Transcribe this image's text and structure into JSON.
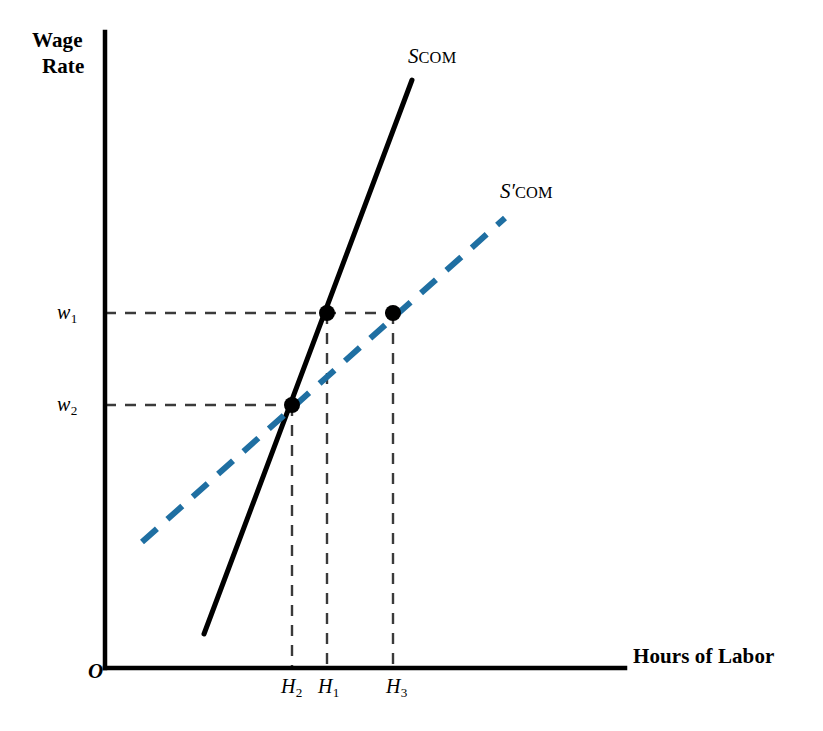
{
  "figure": {
    "axes": {
      "y_title_line1": "Wage",
      "y_title_line2": "Rate",
      "x_title": "Hours of Labor",
      "origin_label": "O"
    },
    "ticks": {
      "y": [
        {
          "name": "w1",
          "symbol": "w",
          "sub": "1"
        },
        {
          "name": "w2",
          "symbol": "w",
          "sub": "2"
        }
      ],
      "x": [
        {
          "name": "H2",
          "symbol": "H",
          "sub": "2"
        },
        {
          "name": "H1",
          "symbol": "H",
          "sub": "1"
        },
        {
          "name": "H3",
          "symbol": "H",
          "sub": "3"
        }
      ]
    },
    "curves": [
      {
        "name": "S_COM",
        "symbol": "S",
        "prime": "",
        "subscript": "COM",
        "style": "solid",
        "color": "#000000"
      },
      {
        "name": "S_COM_prime",
        "symbol": "S",
        "prime": "′",
        "subscript": "COM",
        "style": "dashed",
        "color": "#1f6fa2"
      }
    ],
    "colors": {
      "axis": "#000000",
      "solid_curve": "#000000",
      "dashed_curve": "#1f6fa2",
      "guide_line": "#3a3a3a",
      "point": "#000000",
      "background": "#ffffff"
    }
  },
  "chart_data": {
    "type": "line",
    "title": "",
    "xlabel": "Hours of Labor",
    "ylabel": "Wage Rate",
    "xlim": [
      105,
      625
    ],
    "ylim": [
      668,
      32
    ],
    "grid": false,
    "legend": "inline-curve-labels",
    "axis_origin": {
      "x": 105,
      "y": 668
    },
    "series": [
      {
        "name": "S_COM",
        "label": "S COM",
        "style": "solid",
        "color": "#000000",
        "width": 5,
        "points": [
          [
            204,
            634
          ],
          [
            412,
            80
          ]
        ]
      },
      {
        "name": "S'_COM",
        "label": "S′ COM",
        "style": "dashed",
        "color": "#1f6fa2",
        "width": 6,
        "points": [
          [
            142,
            542
          ],
          [
            505,
            218
          ]
        ]
      }
    ],
    "levels": {
      "w1": 313,
      "w2": 405,
      "H2": 292,
      "H1": 327,
      "H3": 393
    },
    "markers": [
      {
        "name": "point-H1-w1",
        "x": 327,
        "y": 313,
        "r": 8
      },
      {
        "name": "point-H3-w1",
        "x": 393,
        "y": 313,
        "r": 8
      },
      {
        "name": "point-H2-w2",
        "x": 292,
        "y": 405,
        "r": 8
      }
    ],
    "guides": [
      {
        "name": "guide-w1-horizontal",
        "x1": 105,
        "y1": 313,
        "x2": 400,
        "y2": 313
      },
      {
        "name": "guide-w2-horizontal",
        "x1": 105,
        "y1": 405,
        "x2": 296,
        "y2": 405
      },
      {
        "name": "guide-H1-vertical",
        "x1": 327,
        "y1": 313,
        "x2": 327,
        "y2": 668
      },
      {
        "name": "guide-H2-vertical",
        "x1": 292,
        "y1": 405,
        "x2": 292,
        "y2": 668
      },
      {
        "name": "guide-H3-vertical",
        "x1": 393,
        "y1": 313,
        "x2": 393,
        "y2": 668
      }
    ]
  }
}
